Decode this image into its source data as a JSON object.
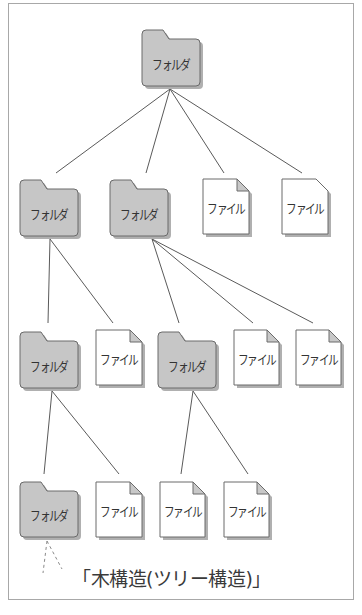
{
  "diagram": {
    "title": "木構造(ツリー構造)",
    "caption": "「木構造(ツリー構造)」",
    "colors": {
      "frame": "#a8a8a8",
      "folder_fill": "#c6c6c6",
      "folder_stroke": "#6a6a6a",
      "file_fill": "#ffffff",
      "file_stroke": "#6a6a6a",
      "fold_fill": "#c8c8c8",
      "edge": "#5a5a5a",
      "shadow": "#b0b0b0"
    },
    "nodes": [
      {
        "id": "root",
        "type": "folder",
        "label": "フォルダ",
        "x": 142,
        "y": 30,
        "w": 58,
        "h": 56
      },
      {
        "id": "l2-folder-a",
        "type": "folder",
        "label": "フォルダ",
        "x": 20,
        "y": 180,
        "w": 58,
        "h": 56
      },
      {
        "id": "l2-folder-b",
        "type": "folder",
        "label": "フォルダ",
        "x": 110,
        "y": 180,
        "w": 58,
        "h": 56
      },
      {
        "id": "l2-file-a",
        "type": "file",
        "label": "ファイル",
        "x": 203,
        "y": 179,
        "w": 46,
        "h": 55
      },
      {
        "id": "l2-file-b",
        "type": "file-plain",
        "label": "ファイル",
        "x": 282,
        "y": 179,
        "w": 46,
        "h": 55
      },
      {
        "id": "l3-folder-a",
        "type": "folder",
        "label": "フォルダ",
        "x": 20,
        "y": 332,
        "w": 58,
        "h": 56
      },
      {
        "id": "l3-file-a",
        "type": "file",
        "label": "ファイル",
        "x": 96,
        "y": 330,
        "w": 46,
        "h": 55
      },
      {
        "id": "l3-folder-b",
        "type": "folder",
        "label": "フォルダ",
        "x": 158,
        "y": 332,
        "w": 58,
        "h": 56
      },
      {
        "id": "l3-file-b",
        "type": "file",
        "label": "ファイル",
        "x": 234,
        "y": 330,
        "w": 45,
        "h": 55
      },
      {
        "id": "l3-file-c",
        "type": "file",
        "label": "ファイル",
        "x": 296,
        "y": 330,
        "w": 45,
        "h": 55
      },
      {
        "id": "l4-folder-a",
        "type": "folder",
        "label": "フォルダ",
        "x": 20,
        "y": 482,
        "w": 58,
        "h": 55
      },
      {
        "id": "l4-file-a",
        "type": "file",
        "label": "ファイル",
        "x": 96,
        "y": 482,
        "w": 46,
        "h": 55
      },
      {
        "id": "l4-file-b",
        "type": "file",
        "label": "ファイル",
        "x": 160,
        "y": 482,
        "w": 45,
        "h": 55
      },
      {
        "id": "l4-file-c",
        "type": "file",
        "label": "ファイル",
        "x": 224,
        "y": 482,
        "w": 45,
        "h": 55
      }
    ],
    "edges": [
      {
        "from": "root",
        "to": "l2-folder-a",
        "x1": 170,
        "y1": 89,
        "x2": 56,
        "y2": 173
      },
      {
        "from": "root",
        "to": "l2-folder-b",
        "x1": 170,
        "y1": 89,
        "x2": 146,
        "y2": 173
      },
      {
        "from": "root",
        "to": "l2-file-a",
        "x1": 170,
        "y1": 89,
        "x2": 224,
        "y2": 173
      },
      {
        "from": "root",
        "to": "l2-file-b",
        "x1": 170,
        "y1": 89,
        "x2": 302,
        "y2": 173
      },
      {
        "from": "l2-folder-a",
        "to": "l3-folder-a",
        "x1": 50,
        "y1": 239,
        "x2": 48,
        "y2": 323
      },
      {
        "from": "l2-folder-a",
        "to": "l3-file-a",
        "x1": 50,
        "y1": 239,
        "x2": 113,
        "y2": 323
      },
      {
        "from": "l2-folder-b",
        "to": "l3-folder-b",
        "x1": 152,
        "y1": 239,
        "x2": 179,
        "y2": 323
      },
      {
        "from": "l2-folder-b",
        "to": "l3-file-b",
        "x1": 152,
        "y1": 239,
        "x2": 253,
        "y2": 323
      },
      {
        "from": "l2-folder-b",
        "to": "l3-file-c",
        "x1": 152,
        "y1": 239,
        "x2": 313,
        "y2": 323
      },
      {
        "from": "l3-folder-a",
        "to": "l4-folder-a",
        "x1": 52,
        "y1": 391,
        "x2": 44,
        "y2": 474
      },
      {
        "from": "l3-folder-a",
        "to": "l4-file-a",
        "x1": 52,
        "y1": 391,
        "x2": 119,
        "y2": 474
      },
      {
        "from": "l3-folder-b",
        "to": "l4-file-b",
        "x1": 193,
        "y1": 391,
        "x2": 181,
        "y2": 474
      },
      {
        "from": "l3-folder-b",
        "to": "l4-file-c",
        "x1": 193,
        "y1": 391,
        "x2": 248,
        "y2": 474
      }
    ],
    "continuation_edges": [
      {
        "from": "l4-folder-a",
        "x1": 47,
        "y1": 541,
        "x2": 43,
        "y2": 573
      },
      {
        "from": "l4-folder-a",
        "x1": 47,
        "y1": 541,
        "x2": 62,
        "y2": 569
      }
    ]
  }
}
